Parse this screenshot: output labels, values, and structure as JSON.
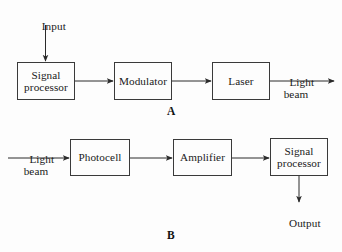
{
  "figure": {
    "background_color": "#fdfdfd",
    "stroke_color": "#2a2a2a",
    "box_border_color": "#3a3a3a",
    "text_color": "#1a1a1a"
  },
  "sections": [
    {
      "id": "A",
      "letter": "A",
      "description": "Optical transmitter chain",
      "boxes": [
        {
          "id": "signal-processor-a",
          "label": "Signal\nprocessor",
          "line1": "Signal",
          "line2": "processor",
          "x": 17,
          "y": 62,
          "width": 58,
          "height": 38
        },
        {
          "id": "modulator",
          "label": "Modulator",
          "line1": "Modulator",
          "line2": "",
          "x": 114,
          "y": 62,
          "width": 58,
          "height": 38
        },
        {
          "id": "laser",
          "label": "Laser",
          "line1": "Laser",
          "line2": "",
          "x": 212,
          "y": 62,
          "width": 58,
          "height": 38
        }
      ],
      "labels": [
        {
          "id": "input-label",
          "text": "Input",
          "x": 28,
          "y": 8
        },
        {
          "id": "light-beam-out-label",
          "line1": "Light",
          "line2": "beam",
          "x": 277,
          "y": 64
        }
      ]
    },
    {
      "id": "B",
      "letter": "B",
      "description": "Optical receiver chain",
      "boxes": [
        {
          "id": "photocell",
          "label": "Photocell",
          "line1": "Photocell",
          "line2": "",
          "x": 70,
          "y": 139,
          "width": 60,
          "height": 37
        },
        {
          "id": "amplifier",
          "label": "Amplifier",
          "line1": "Amplifier",
          "line2": "",
          "x": 173,
          "y": 139,
          "width": 59,
          "height": 37
        },
        {
          "id": "signal-processor-b",
          "label": "Signal\nprocessor",
          "line1": "Signal",
          "line2": "processor",
          "x": 270,
          "y": 138,
          "width": 58,
          "height": 38
        }
      ],
      "labels": [
        {
          "id": "light-beam-in-label",
          "line1": "Light",
          "line2": "beam",
          "x": 16,
          "y": 141
        },
        {
          "id": "output-label",
          "text": "Output",
          "x": 279,
          "y": 206
        }
      ]
    }
  ],
  "connectors": [
    {
      "id": "input-to-signal-processor",
      "from": "Input",
      "to": "Signal processor",
      "direction": "down"
    },
    {
      "id": "signal-processor-to-modulator",
      "from": "Signal processor",
      "to": "Modulator",
      "direction": "right"
    },
    {
      "id": "modulator-to-laser",
      "from": "Modulator",
      "to": "Laser",
      "direction": "right"
    },
    {
      "id": "laser-to-light-beam",
      "from": "Laser",
      "to": "Light beam",
      "direction": "right"
    },
    {
      "id": "light-beam-to-photocell",
      "from": "Light beam",
      "to": "Photocell",
      "direction": "right"
    },
    {
      "id": "photocell-to-amplifier",
      "from": "Photocell",
      "to": "Amplifier",
      "direction": "right"
    },
    {
      "id": "amplifier-to-signal-processor",
      "from": "Amplifier",
      "to": "Signal processor",
      "direction": "right"
    },
    {
      "id": "signal-processor-to-output",
      "from": "Signal processor",
      "to": "Output",
      "direction": "down"
    }
  ]
}
